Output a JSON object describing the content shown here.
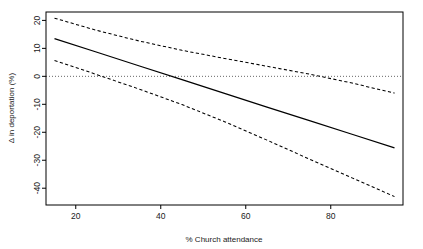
{
  "figure": {
    "background_color": "#ffffff",
    "frame_color": "#000000"
  },
  "chart_data": {
    "type": "line",
    "title": "",
    "subtitle": "",
    "xlabel": "% Church attendance",
    "ylabel": "Δ in deportation (%)",
    "xlim": [
      13,
      97
    ],
    "ylim": [
      -46,
      23
    ],
    "xticks": [
      20,
      40,
      60,
      80
    ],
    "xtick_labels": [
      "20",
      "40",
      "60",
      "80"
    ],
    "yticks": [
      20,
      10,
      0,
      -10,
      -20,
      -30,
      -40
    ],
    "ytick_labels": [
      "20",
      "10",
      "0",
      "-10",
      "-20",
      "-30",
      "-40"
    ],
    "grid": false,
    "legend": null,
    "legend_position": "none",
    "x": [
      15,
      25,
      35,
      45,
      55,
      65,
      75,
      85,
      95
    ],
    "series": [
      {
        "name": "Upper 95% confidence bound",
        "style": "dashed",
        "color": "#000000",
        "values": [
          20.8,
          16.4,
          12.6,
          9.3,
          6.4,
          3.6,
          0.8,
          -2.4,
          -6.0
        ]
      },
      {
        "name": "Fitted effect",
        "style": "solid",
        "color": "#000000",
        "values": [
          13.5,
          8.6,
          3.7,
          -1.2,
          -6.1,
          -11.0,
          -15.8,
          -20.7,
          -25.6
        ]
      },
      {
        "name": "Lower 95% confidence bound",
        "style": "dashed",
        "color": "#000000",
        "values": [
          5.7,
          0.6,
          -4.6,
          -10.1,
          -16.2,
          -22.8,
          -29.6,
          -36.3,
          -43.0
        ]
      }
    ],
    "reference_lines": [
      {
        "name": "zero-line",
        "orientation": "horizontal",
        "value": 0,
        "style": "dotted",
        "color": "#555555"
      }
    ],
    "annotations": [
      {
        "name": "fitted-zero-crossing",
        "x": 42.5,
        "y": 0
      },
      {
        "name": "upper-bound-zero-crossing",
        "x": 77.0,
        "y": 0
      },
      {
        "name": "lower-bound-zero-crossing",
        "x": 26.2,
        "y": 0
      }
    ]
  }
}
